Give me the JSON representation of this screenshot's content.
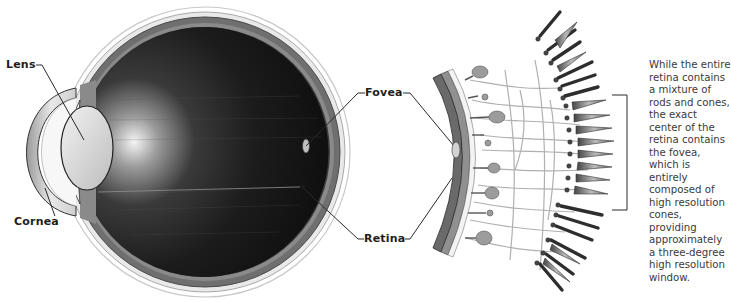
{
  "diagram": {
    "type": "anatomical-illustration",
    "labels": {
      "lens": "Lens",
      "cornea": "Cornea",
      "fovea": "Fovea",
      "retina": "Retina"
    },
    "description": "While the entire retina contains a mixture of rods and cones, the exact center of the retina contains the fovea, which is entirely composed of high resolution cones, providing approximately a three-degree high resolution window.",
    "colors": {
      "vitreous": "#1a1a1a",
      "sclera": "#7a7a7a",
      "lens": "#e2e2e2",
      "leader_line": "#2a2a2a",
      "text": "#3a3a3a"
    }
  }
}
